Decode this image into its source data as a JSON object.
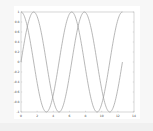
{
  "chart_data": {
    "type": "line",
    "title": "",
    "xlabel": "",
    "ylabel": "",
    "xlim": [
      0,
      14
    ],
    "ylim": [
      -1,
      1
    ],
    "grid": false,
    "legend": null,
    "xticks": [
      "0",
      "2",
      "4",
      "6",
      "8",
      "10",
      "12",
      "14"
    ],
    "yticks": [
      "-1",
      "-0.8",
      "-0.6",
      "-0.4",
      "-0.2",
      "0",
      "0.2",
      "0.4",
      "0.6",
      "0.8",
      "1"
    ],
    "series": [
      {
        "name": "sin(x)",
        "color": "#9a9a9a",
        "x_range": [
          0,
          12.566
        ],
        "x": [
          0,
          1.571,
          3.142,
          4.712,
          6.283,
          7.854,
          9.425,
          10.996,
          12.566
        ],
        "y": [
          0,
          1,
          0,
          -1,
          0,
          1,
          0,
          -1,
          0
        ]
      },
      {
        "name": "cos(x)",
        "color": "#9a9a9a",
        "x_range": [
          0,
          12.566
        ],
        "x": [
          0,
          1.571,
          3.142,
          4.712,
          6.283,
          7.854,
          9.425,
          10.996,
          12.566
        ],
        "y": [
          1,
          0,
          -1,
          0,
          1,
          0,
          -1,
          0,
          1
        ]
      }
    ]
  },
  "plot": {
    "left": 21,
    "right": 134,
    "top": 12,
    "bottom": 112,
    "axis_color": "#bbbbbb",
    "line_color": "#9a9a9a"
  }
}
